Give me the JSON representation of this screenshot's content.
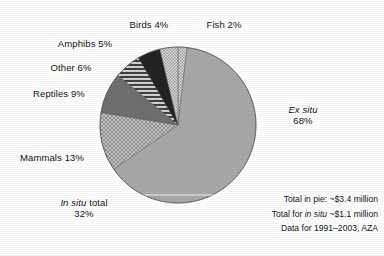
{
  "chart_data": {
    "type": "pie",
    "title": "",
    "subtitle": "",
    "xlabel": "",
    "ylabel": "",
    "legend_position": "none",
    "grid": false,
    "units": "percent of total spending",
    "start_angle_deg": 0,
    "direction": "clockwise",
    "categories": [
      "Fish",
      "Ex situ",
      "Mammals",
      "Reptiles",
      "Other",
      "Amphibs",
      "Birds"
    ],
    "values": [
      2,
      68,
      13,
      9,
      6,
      5,
      4
    ],
    "slices": [
      {
        "label": "Fish 2%",
        "name": "Fish",
        "value": 2,
        "pattern": "checker-light",
        "color": "#cfcfcf"
      },
      {
        "label": "Ex situ 68%",
        "name": "Ex situ",
        "value": 68,
        "pattern": "solid",
        "color": "#a9a9a9"
      },
      {
        "label": "Mammals 13%",
        "name": "Mammals",
        "value": 13,
        "pattern": "crosshatch",
        "color": "#b5b5b5"
      },
      {
        "label": "Reptiles 9%",
        "name": "Reptiles",
        "value": 9,
        "pattern": "solid",
        "color": "#6f6f6f"
      },
      {
        "label": "Other 6%",
        "name": "Other",
        "value": 6,
        "pattern": "h-stripes",
        "color": "#8a8a8a"
      },
      {
        "label": "Amphibs 5%",
        "name": "Amphibs",
        "value": 5,
        "pattern": "solid-dark",
        "color": "#232323"
      },
      {
        "label": "Birds 4%",
        "name": "Birds",
        "value": 4,
        "pattern": "checker-light",
        "color": "#c6c6c6"
      }
    ],
    "groups": [
      {
        "name": "Ex situ total",
        "value": 68
      },
      {
        "name": "In situ total",
        "value": 32
      }
    ],
    "annotations": [
      "Total in pie: ~$3.4 million",
      "Total for in situ ~$1.1 million",
      "Data for 1991–2003, AZA"
    ]
  },
  "labels": {
    "birds": {
      "text": "Birds 4%"
    },
    "fish": {
      "text": "Fish 2%"
    },
    "amphibs": {
      "text": "Amphibs 5%"
    },
    "other": {
      "text": "Other 6%"
    },
    "reptiles": {
      "text": "Reptiles 9%"
    },
    "mammals": {
      "text": "Mammals 13%"
    },
    "ex_situ": {
      "italic": "Ex situ",
      "pct": "68%"
    },
    "in_situ": {
      "italic": "In situ",
      "rest": " total",
      "pct": "32%"
    }
  },
  "notes": {
    "line1_a": "Total in pie: ~$3.4 million",
    "line2_a": "Total for ",
    "line2_it": "in situ",
    "line2_b": " ~$1.1 million",
    "line3": "Data for 1991–2003, AZA"
  },
  "colors": {
    "background": "#ffffff",
    "text": "#141414",
    "ex_situ": "#a9a9a9",
    "mammals": "#b5b5b5",
    "reptiles": "#6f6f6f",
    "other": "#8a8a8a",
    "amphibs": "#232323",
    "birds": "#c6c6c6",
    "fish": "#cfcfcf",
    "divider": "#f2f2f2"
  }
}
